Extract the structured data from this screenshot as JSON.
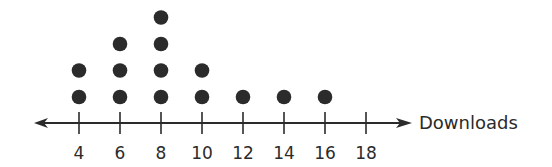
{
  "chart_data": {
    "type": "dot_plot",
    "title": "",
    "xlabel": "Downloads",
    "ylabel": "",
    "categories": [
      4,
      6,
      8,
      10,
      12,
      14,
      16,
      18
    ],
    "values": [
      2,
      3,
      4,
      2,
      1,
      1,
      1,
      0
    ],
    "tick_labels": [
      "4",
      "6",
      "8",
      "10",
      "12",
      "14",
      "16",
      "18"
    ],
    "xlim": [
      3,
      19
    ],
    "grid": false,
    "legend": null,
    "colors": {
      "dot": "#2b2b2b",
      "axis": "#2b2b2b"
    }
  }
}
